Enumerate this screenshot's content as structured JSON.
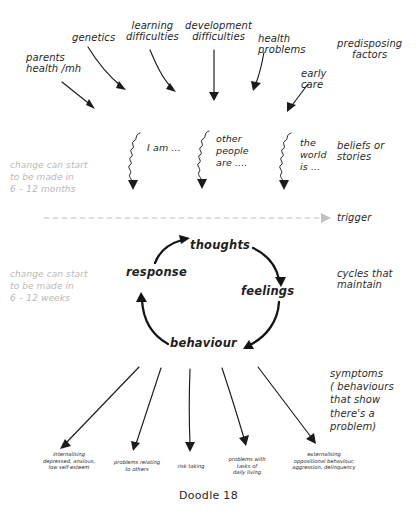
{
  "figure": {
    "caption": "Doodle 18"
  },
  "predisposing": {
    "side_label": "predisposing\nfactors",
    "items": [
      {
        "text": "parents\nhealth /mh"
      },
      {
        "text": "genetics"
      },
      {
        "text": "learning\ndifficulties"
      },
      {
        "text": "development\ndifficulties"
      },
      {
        "text": "health\nproblems"
      },
      {
        "text": "early\ncare"
      }
    ]
  },
  "beliefs": {
    "side_label": "beliefs or\nstories",
    "timing_note": "change can start\nto be made in\n6 – 12 months",
    "items": [
      {
        "text": "I am ..."
      },
      {
        "text": "other\npeople\nare ...."
      },
      {
        "text": "the\nworld\nis ..."
      }
    ]
  },
  "trigger": {
    "side_label": "trigger"
  },
  "cycle": {
    "side_label": "cycles that\nmaintain",
    "timing_note": "change can start\nto be made in\n6 – 12 weeks",
    "nodes": [
      {
        "text": "thoughts"
      },
      {
        "text": "feelings"
      },
      {
        "text": "behaviour"
      },
      {
        "text": "response"
      }
    ]
  },
  "symptoms": {
    "side_label": "symptoms\n( behaviours\nthat show\nthere's a\nproblem)",
    "items": [
      {
        "text": "internalising\ndepressed, anxious,\nlow self-esteem"
      },
      {
        "text": "problems relating\nto others"
      },
      {
        "text": "risk taking"
      },
      {
        "text": "problems with\ntasks of\ndaily living"
      },
      {
        "text": "externalising\noppositional behaviour,\naggression, delinquency"
      }
    ]
  },
  "colors": {
    "ink": "#1b1b1b",
    "grey": "#b9b9b9",
    "background": "#ffffff"
  }
}
